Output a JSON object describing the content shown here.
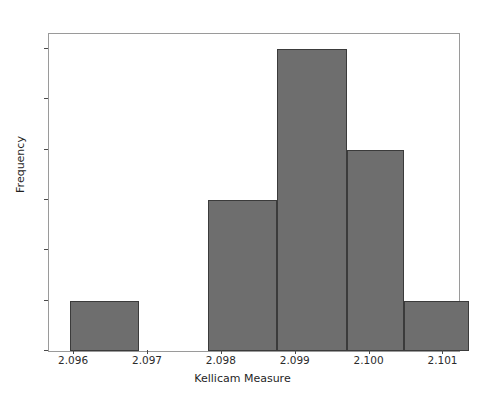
{
  "chart_data": {
    "type": "bar",
    "title": "",
    "xlabel": "Kellicam Measure",
    "ylabel": "Frequency",
    "xlim": [
      2.09566,
      2.10121
    ],
    "ylim": [
      0,
      6.3
    ],
    "grid": false,
    "legend": null,
    "bar_color": "#6e6e6e",
    "bar_edge_color": "#3b3b3b",
    "background_color": "#ffffff",
    "xtick_labels": [
      "2.096",
      "2.097",
      "2.098",
      "2.099",
      "2.100",
      "2.101"
    ],
    "xtick_values": [
      2.096,
      2.097,
      2.098,
      2.099,
      2.1,
      2.101
    ],
    "ytick_labels": [
      "0",
      "1",
      "2",
      "3",
      "4",
      "5",
      "6"
    ],
    "ytick_values": [
      0,
      1,
      2,
      3,
      4,
      5,
      6
    ],
    "categories": [
      "2.0960-2.0965",
      "2.0965-2.0969",
      "2.0969-2.0974",
      "2.0974-2.0978",
      "2.0978-2.0983",
      "2.0983-2.0987",
      "2.0987-2.0992",
      "2.0992-2.0996",
      "2.0996-2.1001",
      "2.1001-2.1005",
      "2.1005-2.1010"
    ],
    "values": [
      1,
      0,
      0,
      0,
      3,
      3,
      6,
      6,
      4,
      4,
      1
    ],
    "bars": [
      {
        "label": "bin-1",
        "x_start": 2.09594,
        "x_end": 2.09688,
        "height": 1
      },
      {
        "label": "bin-2",
        "x_start": 2.09781,
        "x_end": 2.09875,
        "height": 3
      },
      {
        "label": "bin-3",
        "x_start": 2.09875,
        "x_end": 2.09969,
        "height": 6
      },
      {
        "label": "bin-4",
        "x_start": 2.09969,
        "x_end": 2.10047,
        "height": 4
      },
      {
        "label": "bin-5",
        "x_start": 2.10047,
        "x_end": 2.10134,
        "height": 1
      }
    ]
  }
}
